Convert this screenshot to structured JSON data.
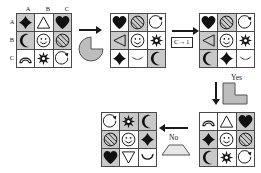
{
  "diagram": {
    "colors": {
      "shaded_cell": "#c9c9c9",
      "empty_cell": "#ffffff",
      "grid_line": "#4a4a4a",
      "ink": "#1a1a1a",
      "operand_fill": "#bcbcbc"
    }
  },
  "grid1": {
    "name": "source-grid",
    "row_labels": [
      "A",
      "B",
      "C"
    ],
    "col_labels": [
      "A",
      "B",
      "C"
    ],
    "cells": [
      {
        "icon": "diamond-icon",
        "shaded": true
      },
      {
        "icon": "triangle-up-icon",
        "shaded": false
      },
      {
        "icon": "heart-icon",
        "shaded": true
      },
      {
        "icon": "crescent-moon-icon",
        "shaded": true
      },
      {
        "icon": "smiley-face-icon",
        "shaded": false
      },
      {
        "icon": "hatched-circle-icon",
        "shaded": true
      },
      {
        "icon": "arc-icon",
        "shaded": false
      },
      {
        "icon": "sunburst-icon",
        "shaded": false
      },
      {
        "icon": "circle-arrow-icon",
        "shaded": false
      }
    ]
  },
  "grid2": {
    "name": "second-grid",
    "cells": [
      {
        "icon": "heart-icon",
        "shaded": false
      },
      {
        "icon": "hatched-circle-icon",
        "shaded": true
      },
      {
        "icon": "circle-arrow-icon",
        "shaded": false
      },
      {
        "icon": "triangle-left-icon",
        "shaded": true
      },
      {
        "icon": "smiley-face-icon",
        "shaded": false
      },
      {
        "icon": "sunburst-icon",
        "shaded": false
      },
      {
        "icon": "diamond-icon",
        "shaded": false
      },
      {
        "icon": "crescent-down-icon",
        "shaded": false
      },
      {
        "icon": "crescent-moon-icon",
        "shaded": true
      }
    ]
  },
  "grid3": {
    "name": "third-grid",
    "cells": [
      {
        "icon": "heart-icon",
        "shaded": false
      },
      {
        "icon": "hatched-circle-icon",
        "shaded": true
      },
      {
        "icon": "circle-arrow-icon",
        "shaded": false
      },
      {
        "icon": "triangle-left-icon",
        "shaded": true
      },
      {
        "icon": "smiley-face-icon",
        "shaded": false
      },
      {
        "icon": "sunburst-icon",
        "shaded": false
      },
      {
        "icon": "crescent-moon-icon",
        "shaded": true
      },
      {
        "icon": "diamond-icon",
        "shaded": false
      },
      {
        "icon": "crescent-down-icon",
        "shaded": false
      }
    ]
  },
  "grid4": {
    "name": "fourth-grid",
    "cells": [
      {
        "icon": "arc-icon",
        "shaded": false
      },
      {
        "icon": "triangle-up-icon",
        "shaded": false
      },
      {
        "icon": "heart-icon",
        "shaded": true
      },
      {
        "icon": "diamond-icon",
        "shaded": true
      },
      {
        "icon": "smiley-face-icon",
        "shaded": false
      },
      {
        "icon": "hatched-circle-icon",
        "shaded": true
      },
      {
        "icon": "crescent-moon-icon",
        "shaded": true
      },
      {
        "icon": "sunburst-icon",
        "shaded": false
      },
      {
        "icon": "circle-arrow-icon",
        "shaded": false
      }
    ]
  },
  "grid5": {
    "name": "fifth-grid",
    "cells": [
      {
        "icon": "circle-arrow-icon",
        "shaded": false
      },
      {
        "icon": "sunburst-icon",
        "shaded": true
      },
      {
        "icon": "crescent-moon-icon",
        "shaded": true
      },
      {
        "icon": "hatched-circle-icon",
        "shaded": true
      },
      {
        "icon": "smiley-face-icon",
        "shaded": false
      },
      {
        "icon": "diamond-icon",
        "shaded": true
      },
      {
        "icon": "heart-icon",
        "shaded": true
      },
      {
        "icon": "triangle-down-icon",
        "shaded": false
      },
      {
        "icon": "curve-up-icon",
        "shaded": false
      }
    ]
  },
  "operands": {
    "pacman": {
      "name": "pacman-shape",
      "label": ""
    },
    "lblock": {
      "name": "l-block-shape",
      "label": ""
    },
    "trapezoid": {
      "name": "trapezoid-shape",
      "label": ""
    }
  },
  "rule": {
    "name": "rule-c-to-1",
    "text": "C→1"
  },
  "branches": {
    "yes": "Yes",
    "no": "No"
  }
}
